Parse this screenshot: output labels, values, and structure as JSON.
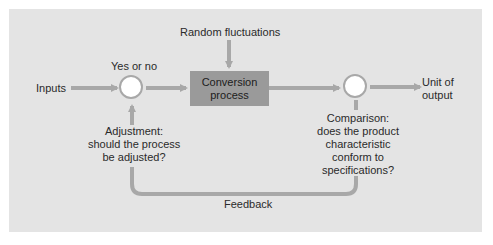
{
  "diagram": {
    "type": "process-control-feedback-loop",
    "colors": {
      "panel": "#e4e4e4",
      "process_box": "#9a9a9a",
      "arrow": "#a8a8a8",
      "text": "#2a2a2a"
    },
    "nodes": {
      "inputs": {
        "label": "Inputs"
      },
      "decision": {
        "label": "Yes or no"
      },
      "process": {
        "line1": "Conversion",
        "line2": "process"
      },
      "disturbance": {
        "label": "Random fluctuations"
      },
      "output": {
        "line1": "Unit of",
        "line2": "output"
      },
      "adjustment": {
        "line1": "Adjustment:",
        "line2": "should the process",
        "line3": "be adjusted?"
      },
      "comparison": {
        "line1": "Comparison:",
        "line2": "does the product",
        "line3": "characteristic",
        "line4": "conform to",
        "line5": "specifications?"
      },
      "feedback": {
        "label": "Feedback"
      }
    },
    "edges": [
      {
        "from": "inputs",
        "to": "decision"
      },
      {
        "from": "decision",
        "to": "process"
      },
      {
        "from": "disturbance",
        "to": "process"
      },
      {
        "from": "process",
        "to": "comparison"
      },
      {
        "from": "comparison",
        "to": "output"
      },
      {
        "from": "comparison",
        "to": "adjustment",
        "label": "Feedback"
      },
      {
        "from": "adjustment",
        "to": "decision"
      }
    ]
  }
}
